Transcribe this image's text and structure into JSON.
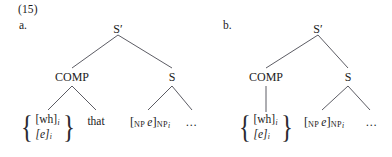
{
  "figure": {
    "example_number": "(15)",
    "background_color": "#ffffff",
    "line_color": "#4a4a52",
    "text_color": "#1b1b1b"
  },
  "trees": [
    {
      "letter": "a.",
      "root": {
        "label": "S′"
      },
      "nodes": {
        "comp": "COMP",
        "s": "S"
      },
      "terminals": {
        "feature_set": {
          "brace_left": "{",
          "brace_right": "}",
          "row1_text": "[wh]",
          "row1_index": "i",
          "row2_text": "[e]",
          "row2_italic": true,
          "row2_index": "i"
        },
        "complementizer": "that",
        "empty_np": {
          "open_bracket": "[",
          "open_label": "NP",
          "content": "e",
          "close_bracket": "]",
          "close_label": "NP",
          "close_index": "i"
        },
        "ellipsis": "…"
      }
    },
    {
      "letter": "b.",
      "root": {
        "label": "S′"
      },
      "nodes": {
        "comp": "COMP",
        "s": "S"
      },
      "terminals": {
        "feature_set": {
          "brace_left": "{",
          "brace_right": "}",
          "row1_text": "[wh]",
          "row1_index": "i",
          "row2_text": "[e]",
          "row2_italic": true,
          "row2_index": "i"
        },
        "empty_np": {
          "open_bracket": "[",
          "open_label": "NP",
          "content": "e",
          "close_bracket": "]",
          "close_label": "NP",
          "close_index": "i"
        },
        "ellipsis": "…"
      }
    }
  ]
}
